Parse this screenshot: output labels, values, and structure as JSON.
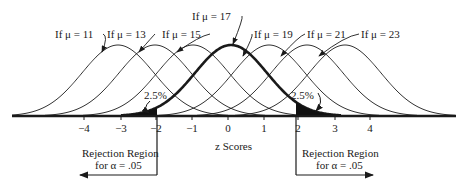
{
  "diagram": {
    "curves": [
      {
        "mu": 11,
        "label": "If μ = 11",
        "peak_x": 118,
        "bold": false,
        "label_x": 55,
        "label_y": 38
      },
      {
        "mu": 13,
        "label": "If μ = 13",
        "peak_x": 155,
        "bold": false,
        "label_x": 107,
        "label_y": 38
      },
      {
        "mu": 15,
        "label": "If μ = 15",
        "peak_x": 193,
        "bold": false,
        "label_x": 162,
        "label_y": 38
      },
      {
        "mu": 17,
        "label": "If μ = 17",
        "peak_x": 231,
        "bold": true,
        "label_x": 192,
        "label_y": 20
      },
      {
        "mu": 19,
        "label": "If μ = 19",
        "peak_x": 269,
        "bold": false,
        "label_x": 254,
        "label_y": 38
      },
      {
        "mu": 21,
        "label": "If μ = 21",
        "peak_x": 307,
        "bold": false,
        "label_x": 307,
        "label_y": 38
      },
      {
        "mu": 23,
        "label": "If μ = 23",
        "peak_x": 345,
        "bold": false,
        "label_x": 361,
        "label_y": 38
      }
    ],
    "axis": {
      "label": "z Scores",
      "ticks": [
        {
          "value": "−4",
          "x": 84
        },
        {
          "value": "−3",
          "x": 121
        },
        {
          "value": "−2",
          "x": 156
        },
        {
          "value": "−1",
          "x": 192
        },
        {
          "value": "0",
          "x": 228
        },
        {
          "value": "1",
          "x": 264
        },
        {
          "value": "2",
          "x": 298
        },
        {
          "value": "3",
          "x": 335
        },
        {
          "value": "4",
          "x": 370
        }
      ]
    },
    "tail_labels": {
      "left": "2.5%",
      "right": "2.5%"
    },
    "rejection_left": {
      "line1": "Rejection Region",
      "line2": "for α = .05"
    },
    "rejection_right": {
      "line1": "Rejection Region",
      "line2": "for α = .05"
    }
  }
}
